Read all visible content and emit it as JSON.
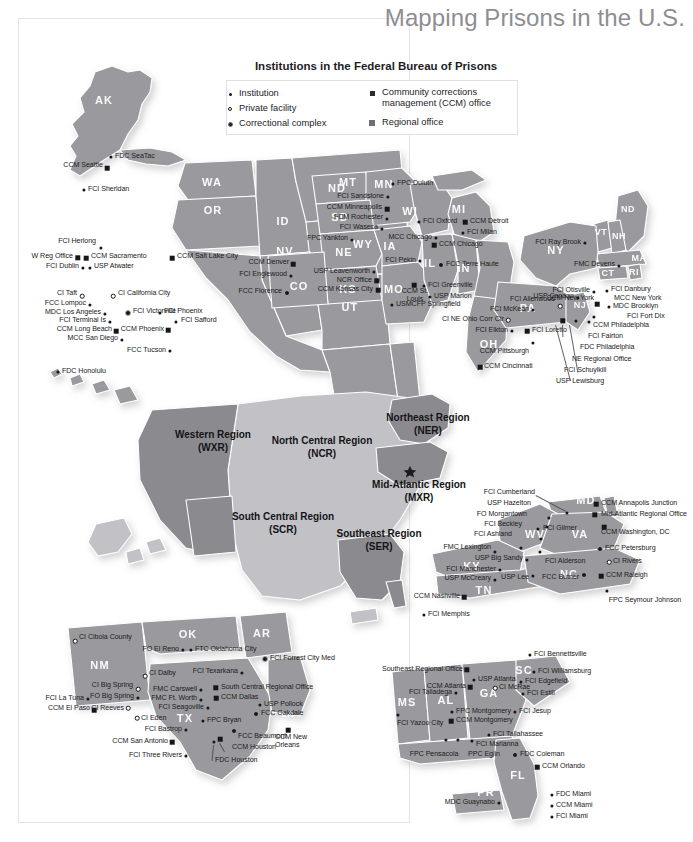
{
  "title": "Mapping Prisons in the U.S.",
  "legend": {
    "heading": "Institutions in the Federal Bureau of Prisons",
    "items": [
      {
        "symbol": "institution-dot",
        "label": "Institution"
      },
      {
        "symbol": "private-facility-ring",
        "label": "Private facility"
      },
      {
        "symbol": "correctional-complex-dot",
        "label": "Correctional complex"
      },
      {
        "symbol": "ccm-office-square",
        "label": "Community corrections management (CCM) office"
      },
      {
        "symbol": "regional-office-square",
        "label": "Regional office"
      }
    ]
  },
  "regions": [
    {
      "name": "Western Region",
      "code": "(WXR)"
    },
    {
      "name": "North Central Region",
      "code": "(NCR)"
    },
    {
      "name": "Northeast Region",
      "code": "(NER)"
    },
    {
      "name": "Mid-Atlantic Region",
      "code": "(MXR)"
    },
    {
      "name": "South Central Region",
      "code": "(SCR)"
    },
    {
      "name": "Southeast Region",
      "code": "(SER)"
    }
  ],
  "states_west": [
    "AK",
    "WA",
    "OR",
    "ID",
    "MT",
    "WY",
    "NV",
    "UT",
    "CA",
    "AZ",
    "HI"
  ],
  "states_midwest": [
    "ND",
    "MN",
    "SD",
    "NE",
    "KS",
    "CO",
    "WI",
    "MI",
    "IA",
    "IL",
    "IN",
    "MO",
    "OH"
  ],
  "states_northeast": [
    "NY",
    "VT",
    "NH",
    "MA",
    "CT",
    "RI",
    "PA",
    "NJ"
  ],
  "states_midatlantic": [
    "MD",
    "DE",
    "WV",
    "VA",
    "KY",
    "TN",
    "NC"
  ],
  "states_southcentral": [
    "NM",
    "OK",
    "AR",
    "TX",
    "LA"
  ],
  "states_southeast": [
    "MS",
    "AL",
    "GA",
    "SC",
    "FL",
    "PR"
  ],
  "facilities_west": [
    "CCM Seattle",
    "FDC SeaTac",
    "FCI Sheridan",
    "FCI Herlong",
    "W Reg Office",
    "CCM Sacramento",
    "FCI Dublin",
    "USP Atwater",
    "CCM Salt Lake City",
    "CI Taft",
    "CI California City",
    "FCC Lompoc",
    "FCI Victorville",
    "MDC Los Angeles",
    "FCI Terminal Is",
    "CCM Long Beach",
    "MCC San Diego",
    "FCI Phoenix",
    "FCI Safford",
    "CCM Phoenix",
    "FCC Tucson",
    "FDC Honolulu"
  ],
  "facilities_midwest": [
    "FPC Duluth",
    "FCI Sandstone",
    "CCM Minneapolis",
    "FCM Rochester",
    "FCI Waseca",
    "FPC Yankton",
    "FCI Oxford",
    "CCM Detroit",
    "FCI Milan",
    "MCC Chicago",
    "CCM Chicago",
    "FCI Pekin",
    "FCC Terre Haute",
    "CCM Denver",
    "FCI Englewood",
    "FCC Florence",
    "USP Leavenworth",
    "NCR Office",
    "CCM Kansas City",
    "CCM St. Louis",
    "FCI Greenville",
    "USP Marion",
    "USMCFP Springfield",
    "CCM Cincinnati"
  ],
  "facilities_northeast": [
    "FCI Ray Brook",
    "FMC Devens",
    "FCI Otisville",
    "USP Canaan",
    "FCI Danbury",
    "MCC New York",
    "MDC Brooklyn",
    "CCM New York",
    "FCI Fort Dix",
    "FCI Danbury",
    "FCI McKean",
    "FCI Allenwood",
    "CI NE Ohio Corr Ctr",
    "FCI Elkton",
    "FCI Loretto",
    "CCM Pittsburgh",
    "CCM Philadelphia",
    "FCI Fairton",
    "FDC Philadelphia",
    "NE Regional Office",
    "FCI Schuylkill",
    "USP Lewisburg"
  ],
  "facilities_midatlantic": [
    "FCI Cumberland",
    "USP Hazelton",
    "FO Morgantown",
    "FCI Beckley",
    "FCI Gilmer",
    "FCI Ashland",
    "FMC Lexington",
    "USP Big Sandy",
    "FCI Alderson",
    "FCI Manchester",
    "USP McCreary",
    "USP Lee",
    "FCC Butner",
    "CCM Nashville",
    "FCI Memphis",
    "CCM Annapolis Junction",
    "Mid-Atlantic Regional Office",
    "CCM Washington, DC",
    "FCC Petersburg",
    "CI Rivers",
    "CCM Raleigh",
    "FPC Seymour Johnson"
  ],
  "facilities_southcentral": [
    "CI Cibola County",
    "FO El Reno",
    "FTC Oklahoma City",
    "FCI Forrest City Med",
    "CI Dalby",
    "FCI Texarkana",
    "CI Big Spring",
    "FO Big Spring",
    "FMC Carswell",
    "South Central Regional Office",
    "CCM Dallas",
    "FMC Ft. Worth",
    "FCI La Tuna",
    "CCM El Paso",
    "CI Reeves",
    "FCI Seagoville",
    "USP Pollock",
    "FCC Oakdale",
    "CI Eden",
    "FPC Bryan",
    "FCI Bastrop",
    "FCC Beaumont",
    "CCM New Orleans",
    "CCM San Antonio",
    "CCM Houston",
    "FCI Three Rivers",
    "FDC Houston"
  ],
  "facilities_southeast": [
    "FCI Bennettsville",
    "Southeast Regional Office",
    "FCI Williamsburg",
    "USP Atlanta",
    "FCI Edgefield",
    "CCM Atlanta",
    "CI McRae",
    "FCI Estill",
    "FCI Talladega",
    "FCI Jesup",
    "FPC Montgomery",
    "CCM Montgomery",
    "FCI Yazoo City",
    "FCI Tallahassee",
    "FCI Marianna",
    "FPC Pensacola",
    "PPC Eglin",
    "FDC Coleman",
    "CCM Orlando",
    "MDC Guaynabo",
    "FDC Miami",
    "CCM Miami",
    "FCI Miami"
  ],
  "colors": {
    "map_fill": "#9a9a9e",
    "map_fill_light": "#c2c2c6",
    "map_fill_dark": "#8a8a8f",
    "frame": "#e3e3e5",
    "title": "#8d8d92",
    "text": "#1a1a1c"
  }
}
